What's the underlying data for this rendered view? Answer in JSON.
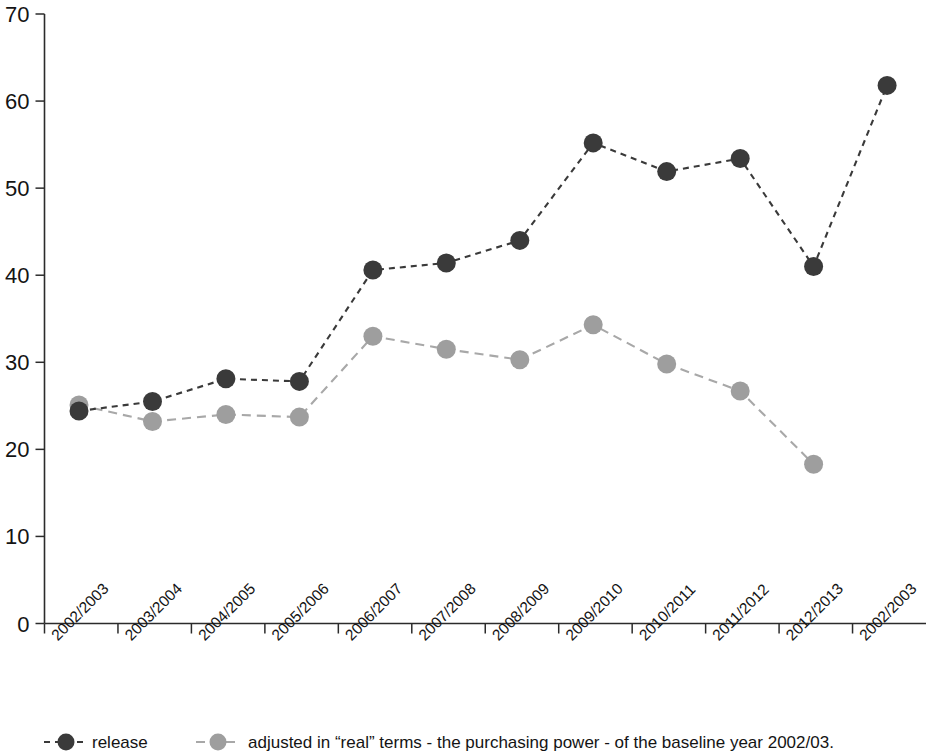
{
  "chart_data": {
    "type": "line",
    "title": "",
    "subtitle": "",
    "xlabel": "",
    "ylabel": "",
    "ylim": [
      0,
      70
    ],
    "ytick_values": [
      0,
      10,
      20,
      30,
      40,
      50,
      60,
      70
    ],
    "ytick_labels": [
      "0",
      "10",
      "20",
      "30",
      "40",
      "50",
      "60",
      "70"
    ],
    "grid": false,
    "legend_position": "bottom",
    "categories": [
      "2002/2003",
      "2003/2004",
      "2004/2005",
      "2005/2006",
      "2006/2007",
      "2007/2008",
      "2008/2009",
      "2009/2010",
      "2010/2011",
      "2011/2012",
      "2012/2013",
      "2002/2003"
    ],
    "series": [
      {
        "name": "release",
        "color": "#3a3a3a",
        "marker": "circle",
        "linestyle": "dotted",
        "values": [
          24.4,
          25.5,
          28.1,
          27.8,
          40.6,
          41.4,
          44.0,
          55.2,
          51.9,
          53.4,
          41.0,
          61.8
        ]
      },
      {
        "name": "adjusted in “real” terms - the purchasing power - of the baseline year 2002/03.",
        "color": "#9e9e9e",
        "marker": "circle",
        "linestyle": "dashed",
        "values": [
          25.1,
          23.2,
          24.0,
          23.7,
          33.0,
          31.5,
          30.3,
          34.3,
          29.8,
          26.7,
          18.3,
          null
        ]
      }
    ]
  },
  "legend": {
    "items": [
      {
        "label": "release",
        "color": "#3a3a3a"
      },
      {
        "label": "adjusted in “real” terms - the purchasing power - of the baseline year 2002/03.",
        "color": "#9e9e9e"
      }
    ]
  },
  "colors": {
    "axis": "#2b2b2b",
    "background": "#ffffff",
    "series_dark": "#3a3a3a",
    "series_gray": "#9e9e9e"
  }
}
